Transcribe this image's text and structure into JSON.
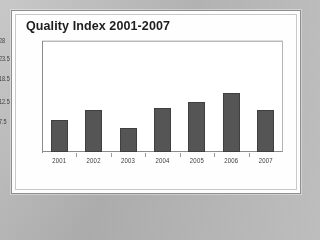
{
  "chart_data": {
    "type": "bar",
    "title": "Quality Index 2001-2007",
    "xlabel": "",
    "ylabel": "",
    "categories": [
      "2001",
      "2002",
      "2003",
      "2004",
      "2005",
      "2006",
      "2007"
    ],
    "values": [
      8,
      10.5,
      6,
      11,
      12.5,
      15,
      10.5
    ],
    "ytick_labels": [
      "28",
      "23.5",
      "18.5",
      "12.5",
      "7.5"
    ],
    "ytick_values": [
      28,
      23.5,
      18.5,
      12.5,
      7.5
    ],
    "ylim": [
      0,
      28
    ],
    "grid": true,
    "legend": false,
    "series": [
      {
        "name": "Quality Index",
        "values": [
          8,
          10.5,
          6,
          11,
          12.5,
          15,
          10.5
        ]
      }
    ]
  },
  "colors": {
    "bar_fill": "#555555",
    "bar_border": "#3f3f3f",
    "plot_background": "#ffffff",
    "gridline": "#d2d2d2",
    "axis": "#8b8b8b",
    "card_background": "#fdfdfd",
    "card_border": "#8e8e8e",
    "page_background": "#b9b9b9",
    "title_text": "#1d1d1d",
    "tick_text": "#3a3a3a"
  }
}
